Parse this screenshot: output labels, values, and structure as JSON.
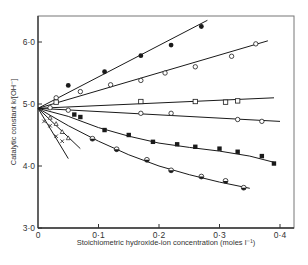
{
  "chart_data": {
    "type": "scatter",
    "title": "",
    "xlabel": "Stoichiometric hydroxide-ion concentration (moles l⁻¹)",
    "ylabel": "Catalytic constant k/[OH⁻]",
    "xlim": [
      0,
      0.42
    ],
    "ylim": [
      3.0,
      6.45
    ],
    "x_ticks": [
      0,
      0.1,
      0.2,
      0.3,
      0.4
    ],
    "x_tick_labels": [
      "0",
      "0·1",
      "0·2",
      "0·3",
      "0·4"
    ],
    "y_ticks": [
      3.0,
      4.0,
      5.0,
      6.0
    ],
    "y_tick_labels": [
      "3·0",
      "4·0",
      "5·0",
      "6·0"
    ],
    "grid": false,
    "legend": "none",
    "common_intercept": {
      "x": 0,
      "y": 4.93
    },
    "series": [
      {
        "name": "filled-circles",
        "marker": "filled-circle",
        "x": [
          0.05,
          0.11,
          0.17,
          0.22,
          0.27
        ],
        "y": [
          5.3,
          5.52,
          5.78,
          5.95,
          6.25
        ],
        "line": [
          [
            0,
            4.93
          ],
          [
            0.28,
            6.35
          ]
        ]
      },
      {
        "name": "open-diamonds",
        "marker": "open-diamond",
        "x": [
          0.03,
          0.07,
          0.12,
          0.17,
          0.21,
          0.26,
          0.32,
          0.36
        ],
        "y": [
          5.1,
          5.2,
          5.31,
          5.38,
          5.5,
          5.6,
          5.77,
          5.97
        ],
        "line": [
          [
            0,
            4.93
          ],
          [
            0.38,
            6.02
          ]
        ]
      },
      {
        "name": "open-squares",
        "marker": "open-square",
        "x": [
          0.03,
          0.17,
          0.26,
          0.31,
          0.33
        ],
        "y": [
          5.03,
          5.04,
          5.04,
          5.03,
          5.05
        ],
        "line": [
          [
            0,
            4.93
          ],
          [
            0.39,
            5.1
          ]
        ]
      },
      {
        "name": "open-circles",
        "marker": "open-circle",
        "x": [
          0.02,
          0.05,
          0.17,
          0.22,
          0.33,
          0.37
        ],
        "y": [
          4.94,
          4.9,
          4.85,
          4.85,
          4.75,
          4.72
        ],
        "line": [
          [
            0,
            4.93
          ],
          [
            0.4,
            4.72
          ]
        ]
      },
      {
        "name": "filled-squares",
        "marker": "filled-square",
        "x": [
          0.06,
          0.07,
          0.11,
          0.15,
          0.19,
          0.23,
          0.26,
          0.3,
          0.33,
          0.37,
          0.39
        ],
        "y": [
          4.83,
          4.79,
          4.58,
          4.5,
          4.39,
          4.35,
          4.31,
          4.28,
          4.23,
          4.16,
          4.04
        ],
        "line": [
          [
            0,
            4.93
          ],
          [
            0.05,
            4.8
          ],
          [
            0.1,
            4.62
          ],
          [
            0.15,
            4.48
          ],
          [
            0.2,
            4.37
          ],
          [
            0.25,
            4.3
          ],
          [
            0.3,
            4.24
          ],
          [
            0.35,
            4.16
          ],
          [
            0.39,
            4.06
          ]
        ]
      },
      {
        "name": "half-filled-circles",
        "marker": "half-circle",
        "x": [
          0.09,
          0.13,
          0.18,
          0.22,
          0.27,
          0.31,
          0.34
        ],
        "y": [
          4.44,
          4.27,
          4.1,
          3.93,
          3.83,
          3.76,
          3.65
        ],
        "line": [
          [
            0,
            4.93
          ],
          [
            0.05,
            4.65
          ],
          [
            0.1,
            4.4
          ],
          [
            0.15,
            4.18
          ],
          [
            0.2,
            4.0
          ],
          [
            0.25,
            3.86
          ],
          [
            0.3,
            3.74
          ],
          [
            0.35,
            3.64
          ]
        ]
      },
      {
        "name": "open-triangles",
        "marker": "open-triangle",
        "x": [
          0.02,
          0.03,
          0.04,
          0.05
        ],
        "y": [
          4.78,
          4.68,
          4.55,
          4.45
        ],
        "line": [
          [
            0,
            4.93
          ],
          [
            0.07,
            4.28
          ]
        ]
      },
      {
        "name": "crosses",
        "marker": "cross",
        "x": [
          0.01,
          0.02,
          0.03,
          0.04
        ],
        "y": [
          4.72,
          4.65,
          4.48,
          4.4
        ],
        "line": [
          [
            0,
            4.93
          ],
          [
            0.05,
            4.12
          ]
        ]
      }
    ]
  },
  "layout": {
    "plot_left": 38,
    "plot_right": 294,
    "plot_top": 16,
    "plot_bottom": 228,
    "x_px_per_unit": 605,
    "y_px_per_unit": 62
  },
  "colors": {
    "ink": "#1a1a1a",
    "frame": "#777777",
    "background": "#ffffff"
  }
}
